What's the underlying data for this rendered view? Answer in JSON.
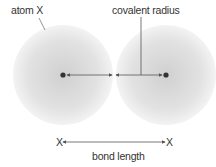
{
  "labels": {
    "atom": "atom X",
    "covalent_radius": "covalent radius",
    "bond_length": "bond length",
    "left_x": "X",
    "right_x": "X"
  },
  "colors": {
    "atom_center": "#d2d2d2",
    "atom_edge": "#f2f2f2",
    "line": "#555555",
    "nucleus": "#333333",
    "text": "#333333"
  }
}
